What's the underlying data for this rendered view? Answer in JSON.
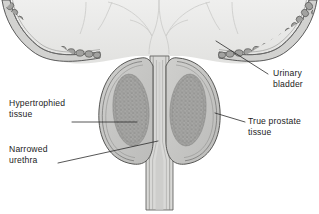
{
  "figure": {
    "background_color": "#ffffff",
    "width": 319,
    "height": 214
  },
  "labels": [
    {
      "id": "hypertrophied-tissue",
      "text": "Hypertrophied\ntissue",
      "side": "left",
      "x": 9,
      "y": 98
    },
    {
      "id": "narrowed-urethra",
      "text": "Narrowed\nurethra",
      "side": "left",
      "x": 9,
      "y": 144
    },
    {
      "id": "urinary-bladder",
      "text": "Urinary\nbladder",
      "side": "right",
      "x": 273,
      "y": 75
    },
    {
      "id": "true-prostate-tissue",
      "text": "True prostate\ntissue",
      "side": "right",
      "x": 248,
      "y": 118
    }
  ],
  "structures": {
    "urinary_bladder": {
      "name": "Urinary bladder",
      "wall_texture": "cobblestone muscle bundles",
      "lumen_color": "#e9e9e8",
      "wall_cell_color": "#a2a2a2",
      "outline_color": "#4a4a4a"
    },
    "prostate_lobes": {
      "name": "True prostate tissue",
      "count": 2,
      "capsule_color": "#c9c9c7",
      "fill_color": "#c2c2c0",
      "outline_color": "#5a5a5a"
    },
    "hypertrophied_nodules": {
      "name": "Hypertrophied tissue",
      "count": 2,
      "fill_color": "#9d9d9b",
      "texture": "stippled"
    },
    "urethra": {
      "name": "Narrowed urethra",
      "lumen_color": "#d6d6d4",
      "state": "narrowed / compressed"
    }
  },
  "colors": {
    "ink": "#1c1c1c",
    "leader_line": "#2b2b2b",
    "outline_dark": "#4a4a4a",
    "outline_mid": "#6b6b6b",
    "tissue_light": "#dcdcda",
    "tissue_mid": "#c2c2c0",
    "tissue_dark": "#9d9d9b",
    "background": "#ffffff"
  }
}
